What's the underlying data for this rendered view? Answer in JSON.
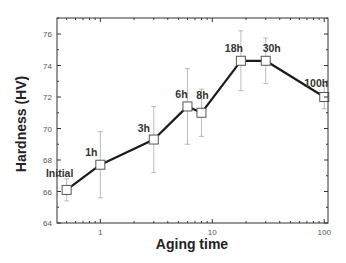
{
  "chart_data": {
    "type": "line",
    "title": "",
    "xlabel": "Aging time",
    "ylabel": "Hardness (HV)",
    "xscale": "log",
    "xlim": [
      0.41,
      108
    ],
    "ylim": [
      64,
      77
    ],
    "xticks": [
      1,
      10,
      100
    ],
    "xtick_labels": [
      "1",
      "10",
      "100"
    ],
    "yticks": [
      64,
      66,
      68,
      70,
      72,
      74,
      76
    ],
    "ytick_labels": [
      "64",
      "66",
      "68",
      "70",
      "72",
      "74",
      "76"
    ],
    "grid": false,
    "legend": null,
    "series": [
      {
        "name": "Hardness",
        "marker": "open-square",
        "line_color": "#1a1a1a",
        "errorbar_color": "#aaaaaa",
        "points": [
          {
            "x": 0.5,
            "y": 66.1,
            "err": 0.7,
            "label": "Initial"
          },
          {
            "x": 1,
            "y": 67.7,
            "err": 2.1,
            "label": "1h"
          },
          {
            "x": 3,
            "y": 69.3,
            "err": 2.1,
            "label": "3h"
          },
          {
            "x": 6,
            "y": 71.4,
            "err": 2.4,
            "label": "6h"
          },
          {
            "x": 8,
            "y": 71.0,
            "err": 1.5,
            "label": "8h"
          },
          {
            "x": 18,
            "y": 74.3,
            "err": 1.9,
            "label": "18h"
          },
          {
            "x": 30,
            "y": 74.3,
            "err": 1.45,
            "label": "30h"
          },
          {
            "x": 100,
            "y": 72.0,
            "err": 0.75,
            "label": "100h"
          }
        ]
      }
    ]
  }
}
